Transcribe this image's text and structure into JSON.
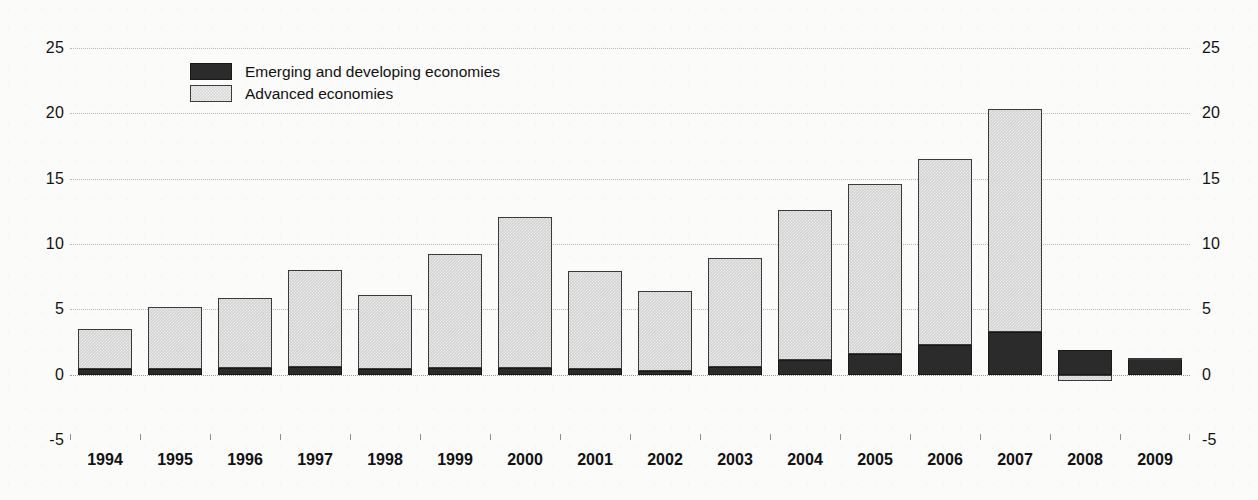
{
  "chart_data": {
    "type": "bar",
    "stacked": true,
    "title": "",
    "subtitle": "",
    "xlabel": "",
    "ylabel": "",
    "ylim": [
      -5,
      25
    ],
    "yticks": [
      25,
      20,
      15,
      10,
      5,
      0,
      -5
    ],
    "ytick_labels": [
      "25",
      "20",
      "15",
      "10",
      "5",
      "0",
      "-5"
    ],
    "grid": true,
    "dual_axis": true,
    "legend_position": "top-left-inside",
    "categories": [
      "1994",
      "1995",
      "1996",
      "1997",
      "1998",
      "1999",
      "2000",
      "2001",
      "2002",
      "2003",
      "2004",
      "2005",
      "2006",
      "2007",
      "2008",
      "2009"
    ],
    "series": [
      {
        "name": "Emerging and developing economies",
        "color": "#2b2b2b",
        "values": [
          0.4,
          0.4,
          0.5,
          0.6,
          0.4,
          0.5,
          0.5,
          0.4,
          0.3,
          0.6,
          1.1,
          1.6,
          2.3,
          3.3,
          1.9,
          1.2
        ]
      },
      {
        "name": "Advanced economies",
        "color": "#d2d2d2",
        "values": [
          3.1,
          4.8,
          5.4,
          7.4,
          5.7,
          8.7,
          11.6,
          7.5,
          6.1,
          8.3,
          11.5,
          13.0,
          14.2,
          17.0,
          -0.5,
          0.1
        ]
      }
    ],
    "totals": [
      3.5,
      5.2,
      5.9,
      8.0,
      6.1,
      9.2,
      12.1,
      7.9,
      6.4,
      8.9,
      12.6,
      14.6,
      16.5,
      20.3,
      1.4,
      1.3
    ]
  },
  "legend": {
    "items": [
      {
        "label": "Emerging and developing economies",
        "swatch": "dark-swatch"
      },
      {
        "label": "Advanced economies",
        "swatch": "light-swatch"
      }
    ]
  },
  "axes": {
    "left_ticks": [
      "25",
      "20",
      "15",
      "10",
      "5",
      "0",
      "-5"
    ],
    "right_ticks": [
      "25",
      "20",
      "15",
      "10",
      "5",
      "0",
      "-5"
    ],
    "x_labels": [
      "1994",
      "1995",
      "1996",
      "1997",
      "1998",
      "1999",
      "2000",
      "2001",
      "2002",
      "2003",
      "2004",
      "2005",
      "2006",
      "2007",
      "2008",
      "2009"
    ]
  },
  "colors": {
    "emerging": "#2b2b2b",
    "advanced": "#d2d2d2",
    "grid": "#b9b9b9",
    "text": "#111111",
    "background": "#fbfbfa"
  }
}
